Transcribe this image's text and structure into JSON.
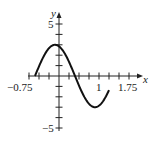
{
  "chart_data": {
    "type": "line",
    "title": "",
    "xlabel": "x",
    "ylabel": "y",
    "xlim": [
      -0.75,
      1.75
    ],
    "ylim": [
      -5,
      5
    ],
    "x_tick_step": 0.25,
    "y_tick_step": 1,
    "x_tick_labels": [
      "-0.75",
      "1",
      "1.75"
    ],
    "y_tick_labels": [
      "5",
      "-5"
    ],
    "grid": false,
    "series": [
      {
        "name": "curve",
        "x": [
          -0.6,
          -0.5,
          -0.4,
          -0.3,
          -0.2,
          -0.1,
          0.0,
          0.1,
          0.2,
          0.3,
          0.4,
          0.5,
          0.6,
          0.7,
          0.8,
          0.9,
          1.0,
          1.1,
          1.2
        ],
        "y": [
          0.0,
          0.93,
          1.76,
          2.43,
          2.85,
          3.0,
          2.85,
          2.43,
          1.76,
          0.93,
          0.0,
          -0.93,
          -1.76,
          -2.43,
          -2.85,
          -3.0,
          -2.85,
          -2.43,
          -1.76
        ]
      }
    ]
  },
  "axis": {
    "x_label": "x",
    "y_label": "y",
    "x_min_label": "−0.75",
    "x_one_label": "1",
    "x_max_label": "1.75",
    "y_max_label": "5",
    "y_min_label": "−5"
  }
}
